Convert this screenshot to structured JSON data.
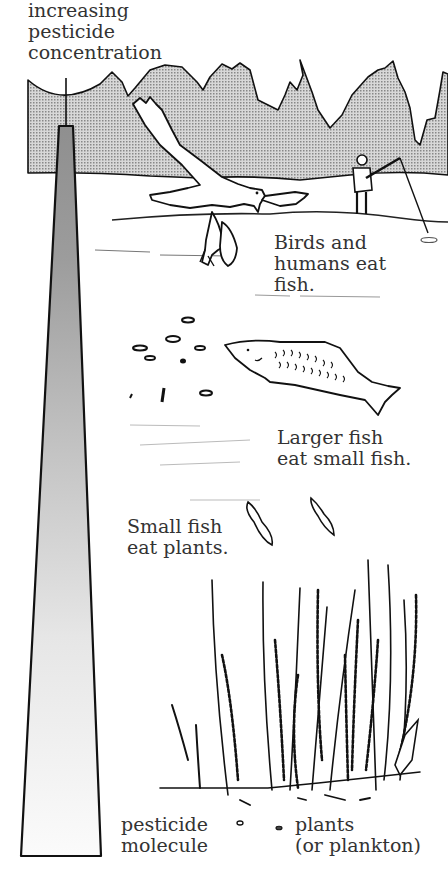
{
  "diagram": {
    "title_label": {
      "lines": [
        "increasing",
        "pesticide",
        "concentration"
      ]
    },
    "levels": [
      {
        "id": "birds-humans",
        "lines": [
          "Birds and",
          "humans eat",
          "fish."
        ]
      },
      {
        "id": "larger-fish",
        "lines": [
          "Larger fish",
          "eat small fish."
        ]
      },
      {
        "id": "small-fish",
        "lines": [
          "Small fish",
          "eat plants."
        ]
      }
    ],
    "legend": [
      {
        "id": "pesticide-molecule",
        "symbol": "small open oval",
        "lines": [
          "pesticide",
          "molecule"
        ]
      },
      {
        "id": "plants",
        "symbol": "small filled oval",
        "lines": [
          "plants",
          "(or plankton)"
        ]
      }
    ],
    "colors": {
      "ink": "#1a1a1a",
      "text": "#333333",
      "mountain_fill": "#b4b4b4",
      "column_top_fill": "#9a9a9a",
      "background": "#ffffff"
    }
  }
}
